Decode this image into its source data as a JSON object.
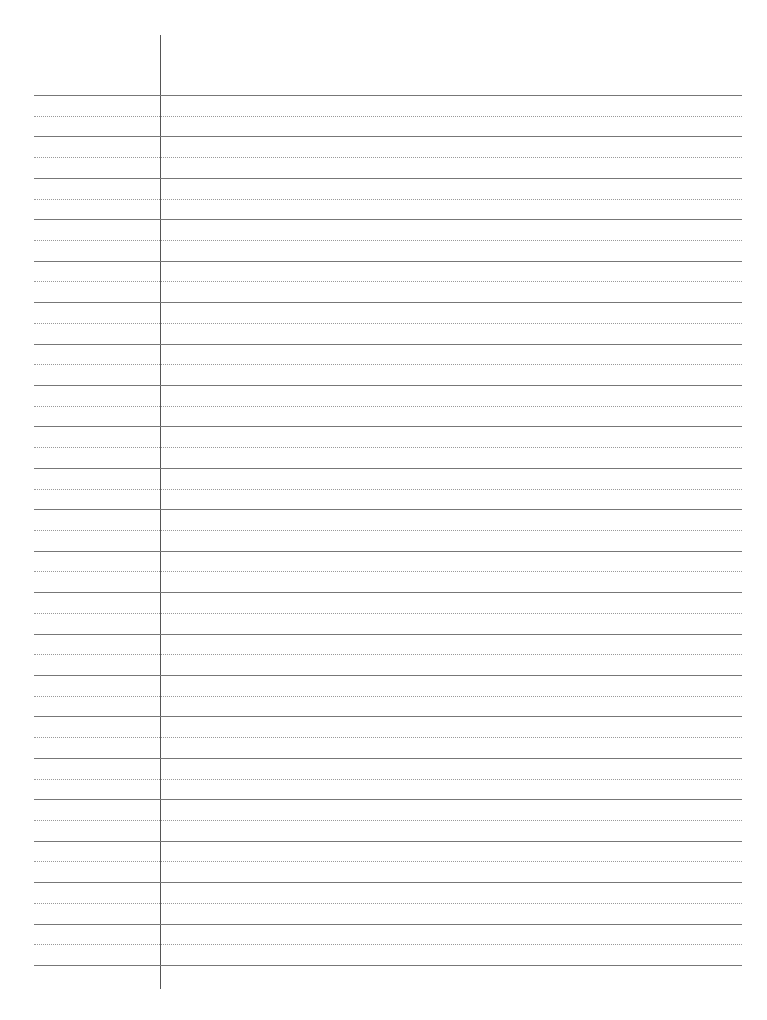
{
  "document": {
    "type": "lined-paper",
    "margin_line_x": 160,
    "first_line_y": 95,
    "line_spacing": 41.43,
    "solid_line_count": 22,
    "colors": {
      "solid": "#777777",
      "dotted": "#999999",
      "margin": "#555555",
      "paper": "#ffffff"
    }
  }
}
